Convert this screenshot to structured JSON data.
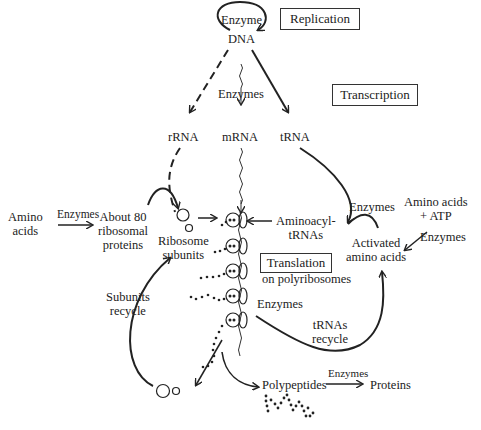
{
  "diagram": {
    "boxes": {
      "replication": "Replication",
      "transcription": "Transcription",
      "translation": "Translation"
    },
    "labels": {
      "enzyme_top": "Enzyme",
      "dna": "DNA",
      "enzymes_transcription": "Enzymes",
      "rrna": "rRNA",
      "mrna": "mRNA",
      "trna": "tRNA",
      "amino_acids_left_1": "Amino",
      "amino_acids_left_2": "acids",
      "enzymes_left": "Enzymes",
      "ribosomal_proteins_1": "About 80",
      "ribosomal_proteins_2": "ribosomal",
      "ribosomal_proteins_3": "proteins",
      "ribosome_subunits_1": "Ribosome",
      "ribosome_subunits_2": "subunits",
      "aminoacyl_1": "Aminoacyl-",
      "aminoacyl_2": "tRNAs",
      "enzymes_right_top": "Enzymes",
      "amino_acids_atp_1": "Amino acids",
      "amino_acids_atp_2": "+ ATP",
      "enzymes_right": "Enzymes",
      "activated_1": "Activated",
      "activated_2": "amino acids",
      "on_polyribosomes": "on polyribosomes",
      "enzymes_middle": "Enzymes",
      "trnas_recycle_1": "tRNAs",
      "trnas_recycle_2": "recycle",
      "subunits_recycle_1": "Subunits",
      "subunits_recycle_2": "recycle",
      "polypeptides": "Polypeptides",
      "enzymes_bottom": "Enzymes",
      "proteins": "Proteins"
    }
  }
}
